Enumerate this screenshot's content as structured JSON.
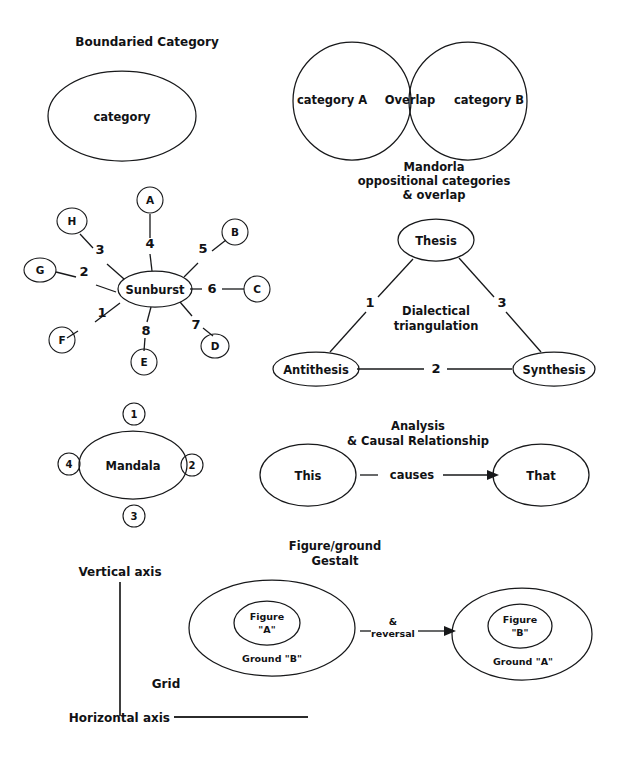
{
  "page": {
    "background": "#ffffff",
    "ink": "#17181a",
    "faint_bleed_text": " "
  },
  "boundaried_category": {
    "title": "Boundaried Category",
    "ellipse_label": "category"
  },
  "mandorla": {
    "left_label": "category A",
    "overlap_label": "Overlap",
    "right_label": "category B",
    "caption_line1": "Mandorla",
    "caption_line2": "oppositional categories",
    "caption_line3": "& overlap"
  },
  "sunburst": {
    "center_label": "Sunburst",
    "spokes": [
      {
        "number": "1",
        "node": "F"
      },
      {
        "number": "2",
        "node": "G"
      },
      {
        "number": "3",
        "node": "H"
      },
      {
        "number": "4",
        "node": "A"
      },
      {
        "number": "5",
        "node": "B"
      },
      {
        "number": "6",
        "node": "C"
      },
      {
        "number": "7",
        "node": "D"
      },
      {
        "number": "8",
        "node": "E"
      }
    ]
  },
  "dialectical": {
    "top_label": "Thesis",
    "left_label": "Antithesis",
    "right_label": "Synthesis",
    "edge_left": "1",
    "edge_bottom": "2",
    "edge_right": "3",
    "caption_line1": "Dialectical",
    "caption_line2": "triangulation"
  },
  "mandala": {
    "center_label": "Mandala",
    "top_number": "1",
    "right_number": "2",
    "bottom_number": "3",
    "left_number": "4"
  },
  "causal": {
    "caption_line1": "Analysis",
    "caption_line2": "& Causal Relationship",
    "source_label": "This",
    "relation_label": "causes",
    "target_label": "That"
  },
  "figure_ground": {
    "caption_line1": "Figure/ground",
    "caption_line2": "Gestalt",
    "left": {
      "figure_line1": "Figure",
      "figure_line2": "\"A\"",
      "ground_label": "Ground \"B\""
    },
    "transition_line1": "&",
    "transition_line2": "reversal",
    "right": {
      "figure_line1": "Figure",
      "figure_line2": "\"B\"",
      "ground_label": "Ground \"A\""
    }
  },
  "grid": {
    "vertical_axis_label": "Vertical axis",
    "horizontal_axis_label": "Horizontal axis",
    "grid_label": "Grid"
  }
}
